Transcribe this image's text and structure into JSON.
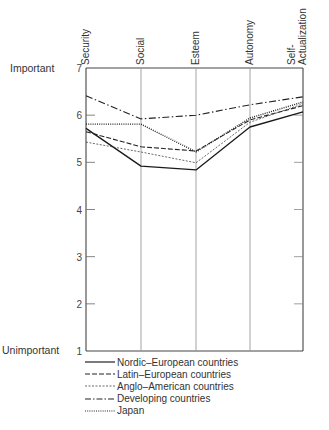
{
  "chart_data": {
    "type": "line",
    "title": "",
    "xlabel": "",
    "ylabel": "",
    "categories": [
      "Security",
      "Social",
      "Esteem",
      "Autonomy",
      "Self-Actualization"
    ],
    "category_labels": [
      [
        "Security"
      ],
      [
        "Social"
      ],
      [
        "Esteem"
      ],
      [
        "Autonomy"
      ],
      [
        "Self-",
        "Actualization"
      ]
    ],
    "ylim": [
      1,
      7
    ],
    "yticks": [
      1,
      2,
      3,
      4,
      5,
      6,
      7
    ],
    "y_top_label": "Important",
    "y_bottom_label": "Unimportant",
    "grid": false,
    "legend_position": "bottom",
    "series": [
      {
        "name": "Nordic-European countries",
        "style": "solid",
        "values": [
          5.72,
          4.92,
          4.84,
          5.75,
          6.07
        ]
      },
      {
        "name": "Latin-European countries",
        "style": "dashed",
        "values": [
          5.65,
          5.33,
          5.24,
          5.9,
          6.2
        ]
      },
      {
        "name": "Anglo-American countries",
        "style": "fine-dashed",
        "values": [
          5.43,
          5.22,
          4.99,
          5.85,
          6.24
        ]
      },
      {
        "name": "Developing countries",
        "style": "dash-dot",
        "values": [
          6.41,
          5.92,
          6.0,
          6.22,
          6.39
        ]
      },
      {
        "name": "Japan",
        "style": "dotted",
        "values": [
          5.81,
          5.81,
          5.22,
          5.94,
          6.28
        ]
      }
    ]
  },
  "legend": {
    "items": [
      {
        "label": "Nordic–European countries",
        "style": "solid"
      },
      {
        "label": "Latin–European countries",
        "style": "dashed"
      },
      {
        "label": "Anglo–American countries",
        "style": "fine-dashed"
      },
      {
        "label": "Developing countries",
        "style": "dash-dot"
      },
      {
        "label": "Japan",
        "style": "dotted"
      }
    ]
  }
}
